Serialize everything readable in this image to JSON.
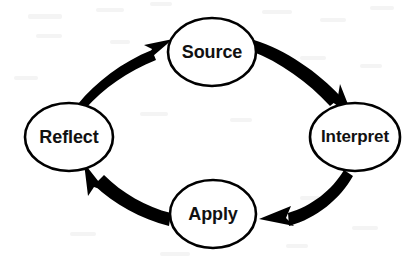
{
  "diagram": {
    "type": "cycle-diagram",
    "background_color": "#ffffff",
    "stroke_color": "#000000",
    "text_color": "#111111",
    "nodes": [
      {
        "id": "source",
        "label": "Source",
        "cx": 212,
        "cy": 52,
        "rx": 44,
        "ry": 34
      },
      {
        "id": "interpret",
        "label": "Interpret",
        "cx": 355,
        "cy": 137,
        "rx": 45,
        "ry": 34
      },
      {
        "id": "apply",
        "label": "Apply",
        "cx": 213,
        "cy": 214,
        "rx": 43,
        "ry": 34
      },
      {
        "id": "reflect",
        "label": "Reflect",
        "cx": 69,
        "cy": 137,
        "rx": 44,
        "ry": 34
      }
    ],
    "edges": [
      {
        "id": "source-to-interpret",
        "from": "Source",
        "to": "Interpret"
      },
      {
        "id": "interpret-to-apply",
        "from": "Interpret",
        "to": "Apply"
      },
      {
        "id": "apply-to-reflect",
        "from": "Apply",
        "to": "Reflect"
      },
      {
        "id": "reflect-to-source",
        "from": "Reflect",
        "to": "Source"
      }
    ]
  }
}
